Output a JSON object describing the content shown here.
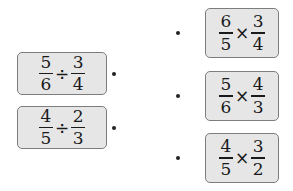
{
  "left_items": [
    {
      "a_num": "5",
      "a_den": "6",
      "op": "÷",
      "b_num": "3",
      "b_den": "4"
    },
    {
      "a_num": "4",
      "a_den": "5",
      "op": "÷",
      "b_num": "2",
      "b_den": "3"
    }
  ],
  "right_items": [
    {
      "a_num": "6",
      "a_den": "5",
      "op": "×",
      "b_num": "3",
      "b_den": "4"
    },
    {
      "a_num": "5",
      "a_den": "6",
      "op": "×",
      "b_num": "4",
      "b_den": "3"
    },
    {
      "a_num": "4",
      "a_den": "5",
      "op": "×",
      "b_num": "3",
      "b_den": "2"
    }
  ]
}
